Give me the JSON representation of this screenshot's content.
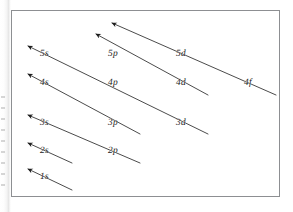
{
  "figure": {
    "name": "aufbau-diagonal-rule-diagram",
    "frame": {
      "stroke": "#8d8f92",
      "fill": "#ffffff"
    },
    "line_color": "#2b2b2b",
    "text_color": "#1b1b1b"
  },
  "orbitals": [
    {
      "id": "1s",
      "label": "1s",
      "n": 1,
      "subshell": "s",
      "x": 40,
      "y": 178,
      "diagonal": 1
    },
    {
      "id": "2s",
      "label": "2s",
      "n": 2,
      "subshell": "s",
      "x": 40,
      "y": 152,
      "diagonal": 2
    },
    {
      "id": "2p",
      "label": "2p",
      "n": 2,
      "subshell": "p",
      "x": 108,
      "y": 152,
      "diagonal": 3
    },
    {
      "id": "3s",
      "label": "3s",
      "n": 3,
      "subshell": "s",
      "x": 40,
      "y": 124,
      "diagonal": 3
    },
    {
      "id": "3p",
      "label": "3p",
      "n": 3,
      "subshell": "p",
      "x": 108,
      "y": 124,
      "diagonal": 4
    },
    {
      "id": "3d",
      "label": "3d",
      "n": 3,
      "subshell": "d",
      "x": 176,
      "y": 124,
      "diagonal": 5
    },
    {
      "id": "4s",
      "label": "4s",
      "n": 4,
      "subshell": "s",
      "x": 40,
      "y": 84,
      "diagonal": 4
    },
    {
      "id": "4p",
      "label": "4p",
      "n": 4,
      "subshell": "p",
      "x": 108,
      "y": 84,
      "diagonal": 5
    },
    {
      "id": "4d",
      "label": "4d",
      "n": 4,
      "subshell": "d",
      "x": 176,
      "y": 84,
      "diagonal": 6
    },
    {
      "id": "4f",
      "label": "4f",
      "n": 4,
      "subshell": "f",
      "x": 244,
      "y": 84,
      "diagonal": 7
    },
    {
      "id": "5s",
      "label": "5s",
      "n": 5,
      "subshell": "s",
      "x": 40,
      "y": 55,
      "diagonal": 5
    },
    {
      "id": "5p",
      "label": "5p",
      "n": 5,
      "subshell": "p",
      "x": 108,
      "y": 55,
      "diagonal": 6
    },
    {
      "id": "5d",
      "label": "5d",
      "n": 5,
      "subshell": "d",
      "x": 176,
      "y": 55,
      "diagonal": 7
    }
  ],
  "arrows": [
    {
      "id": "arrow-1s",
      "covers": [
        "1s"
      ],
      "x1": 72,
      "y1": 190,
      "x2": 28,
      "y2": 169,
      "arrowhead": "start"
    },
    {
      "id": "arrow-2s",
      "covers": [
        "2s"
      ],
      "x1": 72,
      "y1": 163,
      "x2": 28,
      "y2": 143,
      "arrowhead": "start"
    },
    {
      "id": "arrow-2p-3s",
      "covers": [
        "2p",
        "3s"
      ],
      "x1": 140,
      "y1": 163,
      "x2": 28,
      "y2": 115,
      "arrowhead": "start"
    },
    {
      "id": "arrow-3p-4s",
      "covers": [
        "3p",
        "4s"
      ],
      "x1": 140,
      "y1": 134,
      "x2": 28,
      "y2": 74,
      "arrowhead": "start"
    },
    {
      "id": "arrow-3d-4p-5s",
      "covers": [
        "3d",
        "4p",
        "5s"
      ],
      "x1": 208,
      "y1": 134,
      "x2": 28,
      "y2": 46,
      "arrowhead": "start"
    },
    {
      "id": "arrow-4d-5p",
      "covers": [
        "4d",
        "5p"
      ],
      "x1": 208,
      "y1": 95,
      "x2": 96,
      "y2": 34,
      "arrowhead": "start"
    },
    {
      "id": "arrow-4f-5d",
      "covers": [
        "4f",
        "5d"
      ],
      "x1": 276,
      "y1": 95,
      "x2": 112,
      "y2": 23,
      "arrowhead": "start"
    }
  ],
  "chart_data": {
    "type": "diagram",
    "rows": [
      {
        "n": 5,
        "labels": [
          "5s",
          "5p",
          "5d"
        ]
      },
      {
        "n": 4,
        "labels": [
          "4s",
          "4p",
          "4d",
          "4f"
        ]
      },
      {
        "n": 3,
        "labels": [
          "3s",
          "3p",
          "3d"
        ]
      },
      {
        "n": 2,
        "labels": [
          "2s",
          "2p"
        ]
      },
      {
        "n": 1,
        "labels": [
          "1s"
        ]
      }
    ],
    "columns": [
      "s",
      "p",
      "d",
      "f"
    ],
    "fill_order": [
      "1s",
      "2s",
      "2p",
      "3s",
      "3p",
      "4s",
      "3d",
      "4p",
      "5s",
      "4d",
      "5p",
      "5d",
      "4f"
    ],
    "arrow_direction": "down-right to up-left",
    "legend": "none",
    "grid": false
  }
}
